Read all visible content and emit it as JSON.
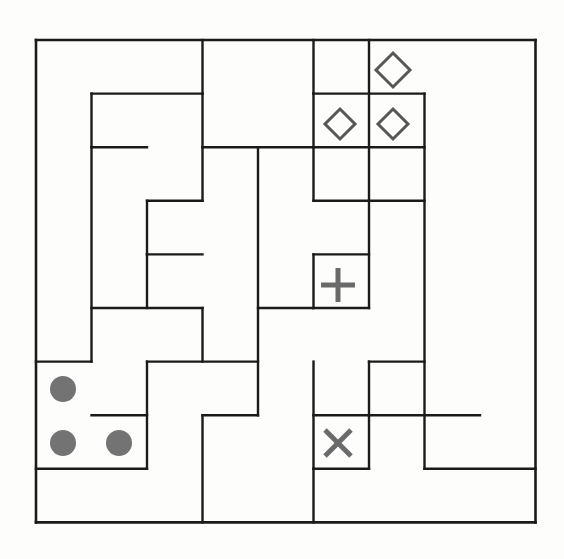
{
  "canvas": {
    "width": 564,
    "height": 559,
    "background_color": "#fdfdfb"
  },
  "puzzle": {
    "kind": "grid-maze-with-markers",
    "title": "Grid Maze With Markers",
    "origin_x": 36,
    "origin_y": 40,
    "cols": 9,
    "rows": 9,
    "cell_w": 55.5,
    "cell_h": 53.6,
    "wall_color": "#1b1b1b",
    "wall_thickness": 2.4,
    "border_thickness": 2.6
  },
  "walls": {
    "border": [
      {
        "name": "outer-border-top",
        "x1": 0,
        "y1": 0,
        "x2": 9,
        "y2": 0
      },
      {
        "name": "outer-border-right",
        "x1": 9,
        "y1": 0,
        "x2": 9,
        "y2": 9
      },
      {
        "name": "outer-border-bottom",
        "x1": 0,
        "y1": 9,
        "x2": 9,
        "y2": 9
      },
      {
        "name": "outer-border-left",
        "x1": 0,
        "y1": 0,
        "x2": 0,
        "y2": 9
      }
    ],
    "horizontal": [
      {
        "name": "wall-h-r1-c1-c3",
        "x1": 1,
        "y1": 1,
        "x2": 3,
        "y2": 1
      },
      {
        "name": "wall-h-r1-c5-c7",
        "x1": 5,
        "y1": 1,
        "x2": 7,
        "y2": 1
      },
      {
        "name": "wall-h-r2-c1-c2",
        "x1": 1,
        "y1": 2,
        "x2": 2,
        "y2": 2
      },
      {
        "name": "wall-h-r2-c3-c5",
        "x1": 3,
        "y1": 2,
        "x2": 5,
        "y2": 2
      },
      {
        "name": "wall-h-r2-c5-c7",
        "x1": 5,
        "y1": 2,
        "x2": 7,
        "y2": 2
      },
      {
        "name": "wall-h-r3-c5-c7",
        "x1": 5,
        "y1": 3,
        "x2": 7,
        "y2": 3
      },
      {
        "name": "wall-h-r3-c2-c3",
        "x1": 2,
        "y1": 3,
        "x2": 3,
        "y2": 3
      },
      {
        "name": "wall-h-r4-c5-c6",
        "x1": 5,
        "y1": 4,
        "x2": 6,
        "y2": 4
      },
      {
        "name": "wall-h-r4-c2-c3",
        "x1": 2,
        "y1": 4,
        "x2": 3,
        "y2": 4
      },
      {
        "name": "wall-h-r5-c1-c3",
        "x1": 1,
        "y1": 5,
        "x2": 3,
        "y2": 5
      },
      {
        "name": "wall-h-r5-c5-c6",
        "x1": 5,
        "y1": 5,
        "x2": 6,
        "y2": 5
      },
      {
        "name": "wall-h-r5-c4-c5",
        "x1": 4,
        "y1": 5,
        "x2": 5,
        "y2": 5
      },
      {
        "name": "wall-h-r6-c0-c1",
        "x1": 0,
        "y1": 6,
        "x2": 1,
        "y2": 6
      },
      {
        "name": "wall-h-r6-c2-c4",
        "x1": 2,
        "y1": 6,
        "x2": 4,
        "y2": 6
      },
      {
        "name": "wall-h-r6-c6-c7",
        "x1": 6,
        "y1": 6,
        "x2": 7,
        "y2": 6
      },
      {
        "name": "wall-h-r7-c1-c2",
        "x1": 1,
        "y1": 7,
        "x2": 2,
        "y2": 7
      },
      {
        "name": "wall-h-r7-c3-c4",
        "x1": 3,
        "y1": 7,
        "x2": 4,
        "y2": 7
      },
      {
        "name": "wall-h-r7-c5-c6",
        "x1": 5,
        "y1": 7,
        "x2": 6,
        "y2": 7
      },
      {
        "name": "wall-h-r7-c6-c8",
        "x1": 6,
        "y1": 7,
        "x2": 8,
        "y2": 7
      },
      {
        "name": "wall-h-r8-c0-c2",
        "x1": 0,
        "y1": 8,
        "x2": 2,
        "y2": 8
      },
      {
        "name": "wall-h-r8-c5-c6",
        "x1": 5,
        "y1": 8,
        "x2": 6,
        "y2": 8
      },
      {
        "name": "wall-h-r8-c7-c9",
        "x1": 7,
        "y1": 8,
        "x2": 9,
        "y2": 8
      }
    ],
    "vertical": [
      {
        "name": "wall-v-c3-r0-r1",
        "x1": 3,
        "y1": 0,
        "x2": 3,
        "y2": 1
      },
      {
        "name": "wall-v-c5-r0-r1",
        "x1": 5,
        "y1": 0,
        "x2": 5,
        "y2": 1
      },
      {
        "name": "wall-v-c6-r0-r3",
        "x1": 6,
        "y1": 0,
        "x2": 6,
        "y2": 3
      },
      {
        "name": "wall-v-c1-r1-r2",
        "x1": 1,
        "y1": 1,
        "x2": 1,
        "y2": 2
      },
      {
        "name": "wall-v-c3-r1-r2",
        "x1": 3,
        "y1": 1,
        "x2": 3,
        "y2": 2
      },
      {
        "name": "wall-v-c5-r1-r3",
        "x1": 5,
        "y1": 1,
        "x2": 5,
        "y2": 3
      },
      {
        "name": "wall-v-c7-r1-r8",
        "x1": 7,
        "y1": 1,
        "x2": 7,
        "y2": 8
      },
      {
        "name": "wall-v-c1-r2-r6",
        "x1": 1,
        "y1": 2,
        "x2": 1,
        "y2": 6
      },
      {
        "name": "wall-v-c3-r2-r3",
        "x1": 3,
        "y1": 2,
        "x2": 3,
        "y2": 3
      },
      {
        "name": "wall-v-c4-r2-r7",
        "x1": 4,
        "y1": 2,
        "x2": 4,
        "y2": 7
      },
      {
        "name": "wall-v-c2-r3-r4",
        "x1": 2,
        "y1": 3,
        "x2": 2,
        "y2": 4
      },
      {
        "name": "wall-v-c6-r3-r5",
        "x1": 6,
        "y1": 3,
        "x2": 6,
        "y2": 5
      },
      {
        "name": "wall-v-c2-r4-r5",
        "x1": 2,
        "y1": 4,
        "x2": 2,
        "y2": 5
      },
      {
        "name": "wall-v-c5-r4-r5",
        "x1": 5,
        "y1": 4,
        "x2": 5,
        "y2": 5
      },
      {
        "name": "wall-v-c3-r5-r6",
        "x1": 3,
        "y1": 5,
        "x2": 3,
        "y2": 6
      },
      {
        "name": "wall-v-c5-r6-r8",
        "x1": 5,
        "y1": 6,
        "x2": 5,
        "y2": 8
      },
      {
        "name": "wall-v-c6-r6-r7",
        "x1": 6,
        "y1": 6,
        "x2": 6,
        "y2": 7
      },
      {
        "name": "wall-v-c2-r6-r8",
        "x1": 2,
        "y1": 6,
        "x2": 2,
        "y2": 8
      },
      {
        "name": "wall-v-c6-r7-r8",
        "x1": 6,
        "y1": 7,
        "x2": 6,
        "y2": 8
      },
      {
        "name": "wall-v-c3-r7-r9",
        "x1": 3,
        "y1": 7,
        "x2": 3,
        "y2": 9
      },
      {
        "name": "wall-v-c5-r8-r9",
        "x1": 5,
        "y1": 8,
        "x2": 5,
        "y2": 9
      }
    ]
  },
  "markers": [
    {
      "name": "marker-diamond-top",
      "glyph": "diamond",
      "col": 6,
      "row": 0,
      "cx": 393,
      "cy": 70,
      "size": 17,
      "color": "#575757",
      "stroke_width": 3
    },
    {
      "name": "marker-diamond-left",
      "glyph": "diamond",
      "col": 5,
      "row": 1,
      "cx": 340,
      "cy": 124,
      "size": 15,
      "color": "#575757",
      "stroke_width": 3
    },
    {
      "name": "marker-diamond-right",
      "glyph": "diamond",
      "col": 6,
      "row": 1,
      "cx": 393,
      "cy": 124,
      "size": 15,
      "color": "#575757",
      "stroke_width": 3
    },
    {
      "name": "marker-plus",
      "glyph": "plus",
      "col": 5,
      "row": 4,
      "cx": 338,
      "cy": 285,
      "size": 17,
      "color": "#6a6a6a",
      "stroke_width": 5
    },
    {
      "name": "marker-cross",
      "glyph": "cross",
      "col": 5,
      "row": 7,
      "cx": 338,
      "cy": 443,
      "size": 13,
      "color": "#6a6a6a",
      "stroke_width": 5
    },
    {
      "name": "marker-dot-upper-left",
      "glyph": "filled-circle",
      "col": 0,
      "row": 6,
      "cx": 63,
      "cy": 389,
      "size": 13,
      "color": "#737373",
      "stroke_width": 0
    },
    {
      "name": "marker-dot-lower-left",
      "glyph": "filled-circle",
      "col": 0,
      "row": 7,
      "cx": 63,
      "cy": 443,
      "size": 13,
      "color": "#737373",
      "stroke_width": 0
    },
    {
      "name": "marker-dot-lower-right",
      "glyph": "filled-circle",
      "col": 1,
      "row": 7,
      "cx": 119,
      "cy": 443,
      "size": 13,
      "color": "#737373",
      "stroke_width": 0
    }
  ],
  "legend": {
    "diamond_count": 3,
    "plus_count": 1,
    "cross_count": 1,
    "dot_count": 3
  }
}
